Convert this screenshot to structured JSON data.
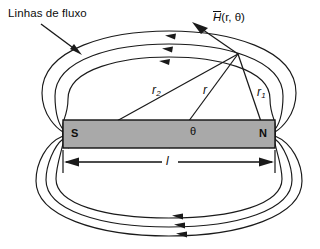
{
  "figure": {
    "title_label": "Linhas de fluxo",
    "field_point_label_h": "H",
    "field_point_label_args": "(r, θ)",
    "pole_south": "S",
    "pole_north": "N",
    "angle_symbol": "θ",
    "length_symbol": "l",
    "radius_center": "r",
    "radius_near_base": "r",
    "radius_near_sub": "1",
    "radius_far_base": "r",
    "radius_far_sub": "2",
    "colors": {
      "background": "#ffffff",
      "magnet_fill": "#a9a9a9",
      "line": "#1a1a1a",
      "text": "#0d0d0d"
    },
    "geometry": {
      "magnet": {
        "x": 63,
        "y": 120,
        "width": 212,
        "height": 28
      },
      "field_point": {
        "x": 238,
        "y": 54
      },
      "south_pole_point": {
        "x": 68,
        "y": 148
      },
      "north_pole_point": {
        "x": 270,
        "y": 148
      },
      "center_point": {
        "x": 169,
        "y": 148
      },
      "dimension_line_y": 162,
      "flux_loop_count_top": 3,
      "flux_loop_count_bottom": 3
    }
  }
}
